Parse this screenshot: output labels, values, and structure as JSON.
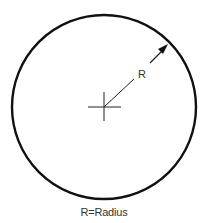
{
  "diagram": {
    "radius_label": "R",
    "caption": "R=Radius",
    "colors": {
      "stroke": "#111111",
      "text": "#333333",
      "background": "#ffffff"
    }
  }
}
